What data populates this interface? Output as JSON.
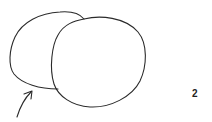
{
  "figure": {
    "label": "2",
    "shapes": [
      {
        "name": "back-circle",
        "kind": "circle"
      },
      {
        "name": "front-circle",
        "kind": "circle"
      }
    ],
    "arrow": {
      "points_to": "back-circle"
    },
    "colors": {
      "stroke": "#2a2a2a",
      "background": "#ffffff"
    }
  }
}
